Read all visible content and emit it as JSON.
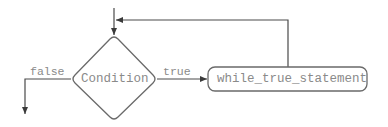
{
  "diagram": {
    "type": "flowchart",
    "nodes": [
      {
        "id": "condition",
        "shape": "diamond",
        "label": "Condition"
      },
      {
        "id": "statement",
        "shape": "rounded-rectangle",
        "label": "while_true_statement"
      }
    ],
    "edges": [
      {
        "from": "entry",
        "to": "condition",
        "label": ""
      },
      {
        "from": "condition",
        "to": "statement",
        "label": "true"
      },
      {
        "from": "condition",
        "to": "exit",
        "label": "false"
      },
      {
        "from": "statement",
        "to": "condition",
        "label": ""
      }
    ],
    "colors": {
      "stroke": "#5a5a5a",
      "text": "#888888",
      "background": "#ffffff"
    }
  },
  "labels": {
    "condition": "Condition",
    "statement": "while_true_statement",
    "true_edge": "true",
    "false_edge": "false"
  }
}
